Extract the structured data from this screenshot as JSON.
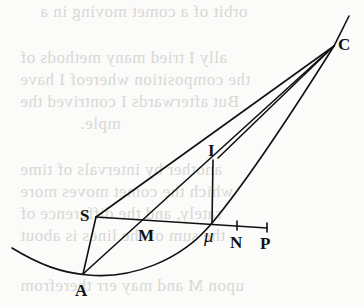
{
  "diagram": {
    "type": "geometric-figure",
    "colors": {
      "ink": "#111111",
      "paper": "#fbfbfa",
      "bleed_text": "#d8d8d5"
    },
    "points": {
      "C": {
        "label": "C",
        "x": 334,
        "y": 46
      },
      "I": {
        "label": "I",
        "x": 213,
        "y": 164
      },
      "S": {
        "label": "S",
        "x": 96,
        "y": 217
      },
      "M": {
        "label": "M",
        "x": 141,
        "y": 220
      },
      "mu": {
        "label": "μ",
        "x": 212,
        "y": 223
      },
      "N": {
        "label": "N",
        "x": 237,
        "y": 226
      },
      "P": {
        "label": "P",
        "x": 267,
        "y": 228
      },
      "A": {
        "label": "A",
        "x": 83,
        "y": 274
      }
    },
    "segments": [
      [
        "S",
        "C"
      ],
      [
        "A",
        "C"
      ],
      [
        "I",
        "C"
      ],
      [
        "S",
        "A"
      ],
      [
        "A",
        "I"
      ],
      [
        "I",
        "mu"
      ],
      [
        "S",
        "P"
      ]
    ],
    "curve": "parabola through A, mu and C"
  },
  "bleed_through_text": {
    "lines": [
      "orbit of a comet moving in a",
      "ally I tried many methods of",
      "the composition whereof I have",
      "But afterwards I contrived the",
      "mple.",
      "another by intervals of time",
      "which the comet moves more",
      "rately, and the difference of",
      "the sum of the lines is about",
      "upon M and may err therefrom"
    ]
  }
}
